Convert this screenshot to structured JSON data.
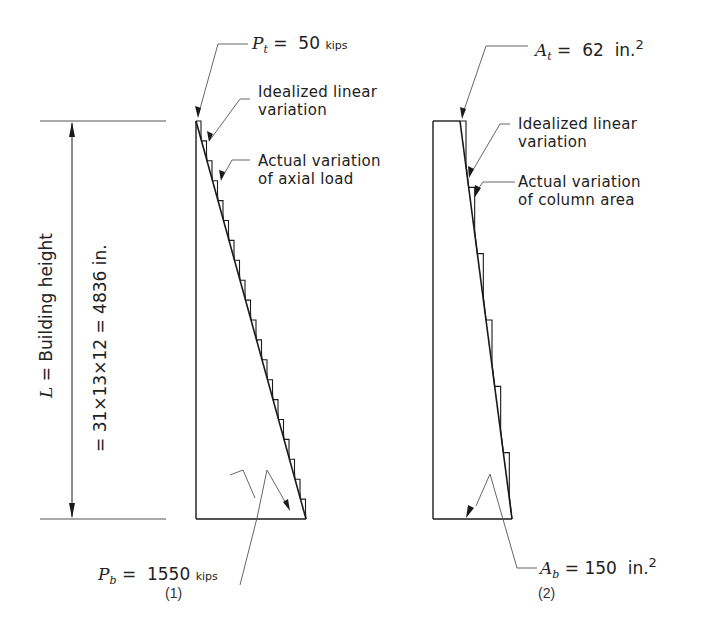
{
  "diagram1": {
    "caption": "(1)",
    "top_label": {
      "symbol": "P",
      "sub": "t",
      "eq": "=",
      "value": "50",
      "unit": "kips"
    },
    "bottom_label": {
      "symbol": "P",
      "sub": "b",
      "eq": "=",
      "value": "1550",
      "unit": "kips"
    },
    "callout_idealized": [
      "Idealized linear",
      "variation"
    ],
    "callout_actual": [
      "Actual variation",
      "of axial load"
    ]
  },
  "diagram2": {
    "caption": "(2)",
    "top_label": {
      "symbol": "A",
      "sub": "t",
      "eq": "=",
      "value": "62",
      "unit": "in.",
      "exp": "2"
    },
    "bottom_label": {
      "symbol": "A",
      "sub": "b",
      "eq": "=",
      "value": "150",
      "unit": "in.",
      "exp": "2"
    },
    "callout_idealized": [
      "Idealized linear",
      "variation"
    ],
    "callout_actual": [
      "Actual variation",
      "of column area"
    ]
  },
  "dimension": {
    "symbol": "L",
    "label": "= Building height",
    "formula": "=  31×13×12  =  4836  in."
  },
  "colors": {
    "line": "#1a1a1a",
    "leader": "#555555",
    "background": "#ffffff"
  }
}
